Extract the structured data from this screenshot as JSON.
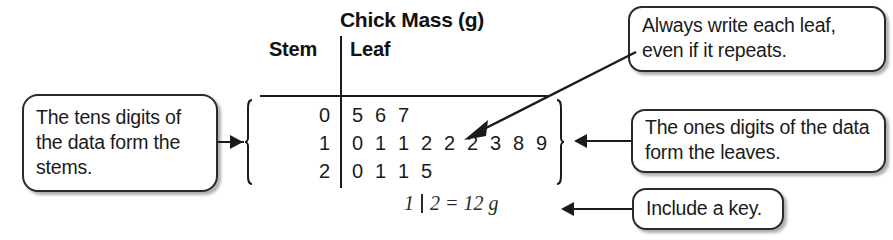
{
  "figure": {
    "title": "Chick Mass (g)",
    "columns": {
      "stem": "Stem",
      "leaf": "Leaf"
    },
    "rows": [
      {
        "stem": "0",
        "leaves": [
          "5",
          "6",
          "7"
        ]
      },
      {
        "stem": "1",
        "leaves": [
          "0",
          "1",
          "1",
          "2",
          "2",
          "2",
          "3",
          "8",
          "9"
        ]
      },
      {
        "stem": "2",
        "leaves": [
          "0",
          "1",
          "1",
          "5"
        ]
      }
    ],
    "key": {
      "stem": "1",
      "leaf": "2",
      "equals": "=",
      "value": "12 g"
    }
  },
  "callouts": {
    "stems": "The tens digits of the data form the stems.",
    "repeats": "Always write each leaf, even if it repeats.",
    "leaves": "The ones digits of the data form the leaves.",
    "key": "Include a key."
  },
  "colors": {
    "ink": "#1b1b1b",
    "box_border": "#2a2a2a",
    "background": "#ffffff"
  }
}
